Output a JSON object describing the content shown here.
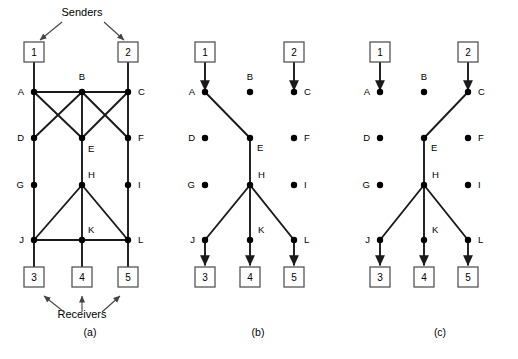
{
  "figure": {
    "title": "",
    "background_color": "#ffffff",
    "stroke_color": "#1a1a1a",
    "node_fill": "#000000",
    "box_stroke": "#555555",
    "annotations": {
      "senders": "Senders",
      "receivers": "Receivers"
    },
    "panels": [
      {
        "id": "a",
        "caption": "(a)",
        "caption_x": 90,
        "caption_y": 336,
        "senders": [
          {
            "name": "sender-box-1",
            "label": "1",
            "x": 34,
            "y": 52
          },
          {
            "name": "sender-box-2",
            "label": "2",
            "x": 128,
            "y": 52
          }
        ],
        "receivers": [
          {
            "name": "receiver-box-3",
            "label": "3",
            "x": 34,
            "y": 277
          },
          {
            "name": "receiver-box-4",
            "label": "4",
            "x": 82,
            "y": 277
          },
          {
            "name": "receiver-box-5",
            "label": "5",
            "x": 128,
            "y": 277
          }
        ],
        "nodes": [
          {
            "id": "A",
            "label": "A",
            "x": 34,
            "y": 92,
            "lx": 24,
            "ly": 95
          },
          {
            "id": "B",
            "label": "B",
            "x": 82,
            "y": 92,
            "lx": 82,
            "ly": 80
          },
          {
            "id": "C",
            "label": "C",
            "x": 128,
            "y": 92,
            "lx": 138,
            "ly": 95
          },
          {
            "id": "D",
            "label": "D",
            "x": 34,
            "y": 138,
            "lx": 24,
            "ly": 141
          },
          {
            "id": "E",
            "label": "E",
            "x": 82,
            "y": 138,
            "lx": 88,
            "ly": 152
          },
          {
            "id": "F",
            "label": "F",
            "x": 128,
            "y": 138,
            "lx": 138,
            "ly": 141
          },
          {
            "id": "G",
            "label": "G",
            "x": 34,
            "y": 185,
            "lx": 24,
            "ly": 188
          },
          {
            "id": "H",
            "label": "H",
            "x": 82,
            "y": 185,
            "lx": 88,
            "ly": 178
          },
          {
            "id": "I",
            "label": "I",
            "x": 128,
            "y": 185,
            "lx": 138,
            "ly": 188
          },
          {
            "id": "J",
            "label": "J",
            "x": 34,
            "y": 240,
            "lx": 24,
            "ly": 243
          },
          {
            "id": "K",
            "label": "K",
            "x": 82,
            "y": 240,
            "lx": 88,
            "ly": 233
          },
          {
            "id": "L",
            "label": "L",
            "x": 128,
            "y": 240,
            "lx": 138,
            "ly": 243
          }
        ],
        "edges": [
          [
            "A",
            "B"
          ],
          [
            "B",
            "C"
          ],
          [
            "A",
            "D"
          ],
          [
            "A",
            "E"
          ],
          [
            "B",
            "D"
          ],
          [
            "B",
            "E"
          ],
          [
            "B",
            "F"
          ],
          [
            "C",
            "E"
          ],
          [
            "C",
            "F"
          ],
          [
            "D",
            "G"
          ],
          [
            "E",
            "H"
          ],
          [
            "F",
            "I"
          ],
          [
            "G",
            "J"
          ],
          [
            "H",
            "J"
          ],
          [
            "H",
            "K"
          ],
          [
            "H",
            "L"
          ],
          [
            "I",
            "L"
          ],
          [
            "J",
            "K"
          ],
          [
            "K",
            "L"
          ]
        ],
        "links_to_boxes": [
          {
            "from": "1",
            "to": "A"
          },
          {
            "from": "2",
            "to": "C"
          },
          {
            "from": "J",
            "to": "3"
          },
          {
            "from": "K",
            "to": "4"
          },
          {
            "from": "L",
            "to": "5"
          }
        ],
        "arrows": []
      },
      {
        "id": "b",
        "caption": "(b)",
        "caption_x": 258,
        "caption_y": 336,
        "senders": [
          {
            "name": "sender-box-1",
            "label": "1",
            "x": 205,
            "y": 52
          },
          {
            "name": "sender-box-2",
            "label": "2",
            "x": 294,
            "y": 52
          }
        ],
        "receivers": [
          {
            "name": "receiver-box-3",
            "label": "3",
            "x": 205,
            "y": 277
          },
          {
            "name": "receiver-box-4",
            "label": "4",
            "x": 250,
            "y": 277
          },
          {
            "name": "receiver-box-5",
            "label": "5",
            "x": 294,
            "y": 277
          }
        ],
        "nodes": [
          {
            "id": "A",
            "label": "A",
            "x": 205,
            "y": 92,
            "lx": 195,
            "ly": 95
          },
          {
            "id": "B",
            "label": "B",
            "x": 250,
            "y": 92,
            "lx": 250,
            "ly": 80
          },
          {
            "id": "C",
            "label": "C",
            "x": 294,
            "y": 92,
            "lx": 304,
            "ly": 95
          },
          {
            "id": "D",
            "label": "D",
            "x": 205,
            "y": 138,
            "lx": 195,
            "ly": 141
          },
          {
            "id": "E",
            "label": "E",
            "x": 250,
            "y": 138,
            "lx": 257,
            "ly": 151
          },
          {
            "id": "F",
            "label": "F",
            "x": 294,
            "y": 138,
            "lx": 304,
            "ly": 141
          },
          {
            "id": "G",
            "label": "G",
            "x": 205,
            "y": 185,
            "lx": 195,
            "ly": 188
          },
          {
            "id": "H",
            "label": "H",
            "x": 250,
            "y": 185,
            "lx": 258,
            "ly": 178
          },
          {
            "id": "I",
            "label": "I",
            "x": 294,
            "y": 185,
            "lx": 304,
            "ly": 188
          },
          {
            "id": "J",
            "label": "J",
            "x": 205,
            "y": 240,
            "lx": 195,
            "ly": 243
          },
          {
            "id": "K",
            "label": "K",
            "x": 250,
            "y": 240,
            "lx": 258,
            "ly": 233
          },
          {
            "id": "L",
            "label": "L",
            "x": 294,
            "y": 240,
            "lx": 304,
            "ly": 243
          }
        ],
        "edges": [
          [
            "A",
            "E"
          ],
          [
            "E",
            "H"
          ],
          [
            "H",
            "J"
          ],
          [
            "H",
            "K"
          ],
          [
            "H",
            "L"
          ]
        ],
        "links_to_boxes": [
          {
            "from": "1",
            "to": "A",
            "arrow": true
          },
          {
            "from": "2",
            "to": "C",
            "arrow": true
          },
          {
            "from": "J",
            "to": "3",
            "arrow": true
          },
          {
            "from": "K",
            "to": "4",
            "arrow": true
          },
          {
            "from": "L",
            "to": "5",
            "arrow": true
          }
        ],
        "arrows": []
      },
      {
        "id": "c",
        "caption": "(c)",
        "caption_x": 440,
        "caption_y": 336,
        "senders": [
          {
            "name": "sender-box-1",
            "label": "1",
            "x": 380,
            "y": 52
          },
          {
            "name": "sender-box-2",
            "label": "2",
            "x": 468,
            "y": 52
          }
        ],
        "receivers": [
          {
            "name": "receiver-box-3",
            "label": "3",
            "x": 380,
            "y": 277
          },
          {
            "name": "receiver-box-4",
            "label": "4",
            "x": 424,
            "y": 277
          },
          {
            "name": "receiver-box-5",
            "label": "5",
            "x": 468,
            "y": 277
          }
        ],
        "nodes": [
          {
            "id": "A",
            "label": "A",
            "x": 380,
            "y": 92,
            "lx": 370,
            "ly": 95
          },
          {
            "id": "B",
            "label": "B",
            "x": 424,
            "y": 92,
            "lx": 424,
            "ly": 80
          },
          {
            "id": "C",
            "label": "C",
            "x": 468,
            "y": 92,
            "lx": 478,
            "ly": 95
          },
          {
            "id": "D",
            "label": "D",
            "x": 380,
            "y": 138,
            "lx": 370,
            "ly": 141
          },
          {
            "id": "E",
            "label": "E",
            "x": 424,
            "y": 138,
            "lx": 431,
            "ly": 151
          },
          {
            "id": "F",
            "label": "F",
            "x": 468,
            "y": 138,
            "lx": 478,
            "ly": 141
          },
          {
            "id": "G",
            "label": "G",
            "x": 380,
            "y": 185,
            "lx": 370,
            "ly": 188
          },
          {
            "id": "H",
            "label": "H",
            "x": 424,
            "y": 185,
            "lx": 432,
            "ly": 178
          },
          {
            "id": "I",
            "label": "I",
            "x": 468,
            "y": 185,
            "lx": 478,
            "ly": 188
          },
          {
            "id": "J",
            "label": "J",
            "x": 380,
            "y": 240,
            "lx": 370,
            "ly": 243
          },
          {
            "id": "K",
            "label": "K",
            "x": 424,
            "y": 240,
            "lx": 432,
            "ly": 233
          },
          {
            "id": "L",
            "label": "L",
            "x": 468,
            "y": 240,
            "lx": 478,
            "ly": 243
          }
        ],
        "edges": [
          [
            "C",
            "E"
          ],
          [
            "E",
            "H"
          ],
          [
            "H",
            "J"
          ],
          [
            "H",
            "K"
          ],
          [
            "H",
            "L"
          ]
        ],
        "links_to_boxes": [
          {
            "from": "1",
            "to": "A",
            "arrow": true
          },
          {
            "from": "2",
            "to": "C",
            "arrow": true
          },
          {
            "from": "J",
            "to": "3",
            "arrow": true
          },
          {
            "from": "K",
            "to": "4",
            "arrow": true
          },
          {
            "from": "L",
            "to": "5",
            "arrow": true
          }
        ],
        "arrows": []
      }
    ],
    "senders_label": {
      "text": "Senders",
      "x": 82,
      "y": 16
    },
    "receivers_label": {
      "text": "Receivers",
      "x": 82,
      "y": 318
    },
    "senders_pointers": [
      {
        "from": [
          62,
          22
        ],
        "to": [
          40,
          40
        ]
      },
      {
        "from": [
          104,
          22
        ],
        "to": [
          124,
          40
        ]
      }
    ],
    "receivers_pointers": [
      {
        "from": [
          64,
          312
        ],
        "to": [
          44,
          296
        ]
      },
      {
        "from": [
          82,
          312
        ],
        "to": [
          82,
          296
        ]
      },
      {
        "from": [
          102,
          312
        ],
        "to": [
          120,
          296
        ]
      }
    ]
  }
}
